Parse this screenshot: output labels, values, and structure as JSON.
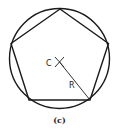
{
  "figure": {
    "caption": "(c)",
    "center_label": "C",
    "radius_label": "R",
    "shapes": {
      "circle": {
        "cx": 59.5,
        "cy": 58.5,
        "r": 50
      },
      "pentagon": [
        [
          60,
          12
        ],
        [
          110,
          49
        ],
        [
          92,
          101
        ],
        [
          31,
          101
        ],
        [
          12,
          48
        ]
      ],
      "radius_line": {
        "x1": 59,
        "y1": 64,
        "x2": 92,
        "y2": 101
      },
      "center_cross": {
        "cx": 59,
        "cy": 62,
        "size": 5
      }
    },
    "stroke_color": "#1a1a1a"
  }
}
